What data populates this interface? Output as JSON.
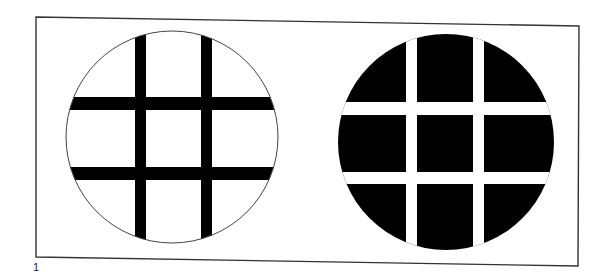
{
  "figure": {
    "label": "1",
    "colors": {
      "background": "#ffffff",
      "ink": "#000000",
      "frame": "#333333"
    },
    "frame": {
      "x1": 36,
      "y1": 17,
      "x2": 579,
      "y2": 262
    },
    "left_circle": {
      "cx": 172,
      "cy": 137,
      "r": 106,
      "fill": "#ffffff",
      "stroke": "#444444",
      "bars_color": "#000000",
      "vertical_bars": [
        {
          "x": 135,
          "w": 11
        },
        {
          "x": 201,
          "w": 11
        }
      ],
      "horizontal_bars": [
        {
          "y": 97,
          "h": 13
        },
        {
          "y": 167,
          "h": 13
        }
      ]
    },
    "right_circle": {
      "cx": 446,
      "cy": 142,
      "r": 108,
      "fill": "#000000",
      "gaps_color": "#ffffff",
      "vertical_gaps": [
        {
          "x": 406,
          "w": 11
        },
        {
          "x": 473,
          "w": 11
        }
      ],
      "horizontal_gaps": [
        {
          "y": 102,
          "h": 13
        },
        {
          "y": 172,
          "h": 12
        }
      ]
    }
  }
}
